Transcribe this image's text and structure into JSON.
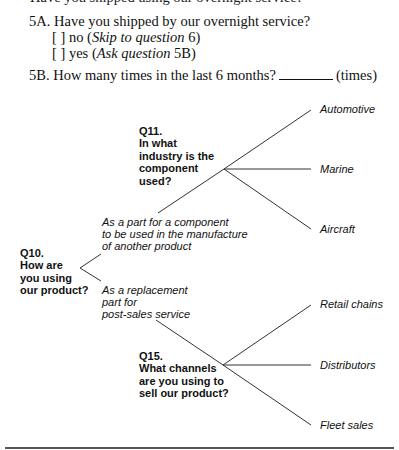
{
  "survey": {
    "cut_line": "Have you shipped using our overnight service?",
    "q5a": {
      "label": "5A. Have you shipped by our overnight service?",
      "options": [
        {
          "box": "[ ]",
          "text": "no (",
          "instruction_italic": "Skip to question",
          "instruction_rest": " 6)"
        },
        {
          "box": "[ ]",
          "text": "yes (",
          "instruction_italic": "Ask question",
          "instruction_rest": " 5B)"
        }
      ]
    },
    "q5b": {
      "label": "5B. How many times in the last 6 months?",
      "unit": "(times)"
    }
  },
  "tree": {
    "q10": {
      "lines": [
        "Q10.",
        "How are",
        "you using",
        "our product?"
      ]
    },
    "q10_options": [
      {
        "lines": [
          "As a part for a component",
          "to be used in the manufacture",
          "of another product"
        ]
      },
      {
        "lines": [
          "As a replacement",
          "part for",
          "post-sales service"
        ]
      }
    ],
    "q11": {
      "lines": [
        "Q11.",
        "In what",
        "industry is the",
        "component",
        "used?"
      ]
    },
    "q11_answers": [
      "Automotive",
      "Marine",
      "Aircraft"
    ],
    "q15": {
      "lines": [
        "Q15.",
        "What channels",
        "are you using to",
        "sell our product?"
      ]
    },
    "q15_answers": [
      "Retail chains",
      "Distributors",
      "Fleet sales"
    ]
  },
  "colors": {
    "line": "#333333",
    "rule": "#555555",
    "text": "#111111"
  }
}
